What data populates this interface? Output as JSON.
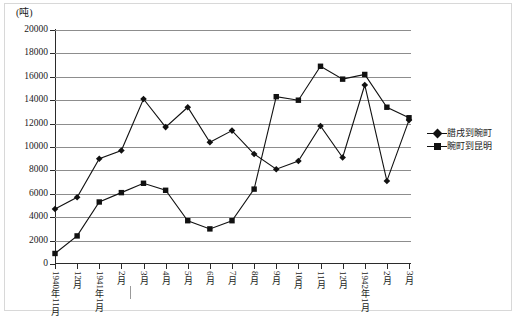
{
  "unit_label": "(吨)",
  "legend": {
    "position": "right",
    "items": [
      {
        "label": "腊戌到畹町",
        "marker": "diamond",
        "color": "#111111"
      },
      {
        "label": "畹町到昆明",
        "marker": "square",
        "color": "#111111"
      }
    ]
  },
  "axes": {
    "y_ticks": [
      "0",
      "2000",
      "4000",
      "6000",
      "8000",
      "10000",
      "12000",
      "14000",
      "16000",
      "18000",
      "20000"
    ],
    "x_ticks": [
      "1940年11月",
      "12月",
      "1941年1月",
      "2月",
      "3月",
      "4月",
      "5月",
      "6月",
      "7月",
      "8月",
      "9月",
      "10月",
      "11月",
      "12月",
      "1942年1月",
      "2月",
      "3月"
    ]
  },
  "chart_data": {
    "type": "line",
    "title": "",
    "subtitle": "",
    "xlabel": "",
    "ylabel": "(吨)",
    "ylim": [
      0,
      20000
    ],
    "ytick_step": 2000,
    "grid": true,
    "legend_position": "right",
    "categories": [
      "1940年11月",
      "12月",
      "1941年1月",
      "2月",
      "3月",
      "4月",
      "5月",
      "6月",
      "7月",
      "8月",
      "9月",
      "10月",
      "11月",
      "12月",
      "1942年1月",
      "2月",
      "3月"
    ],
    "series": [
      {
        "name": "腊戌到畹町",
        "marker": "diamond",
        "color": "#111111",
        "values": [
          4700,
          5700,
          9000,
          9700,
          14100,
          11700,
          13400,
          10400,
          11400,
          9400,
          8100,
          8800,
          11800,
          9100,
          15300,
          7100,
          12300
        ]
      },
      {
        "name": "畹町到昆明",
        "marker": "square",
        "color": "#111111",
        "values": [
          900,
          2400,
          5300,
          6100,
          6900,
          6300,
          3700,
          3000,
          3700,
          6400,
          14300,
          14000,
          16900,
          15800,
          16200,
          13400,
          12500
        ]
      }
    ]
  }
}
